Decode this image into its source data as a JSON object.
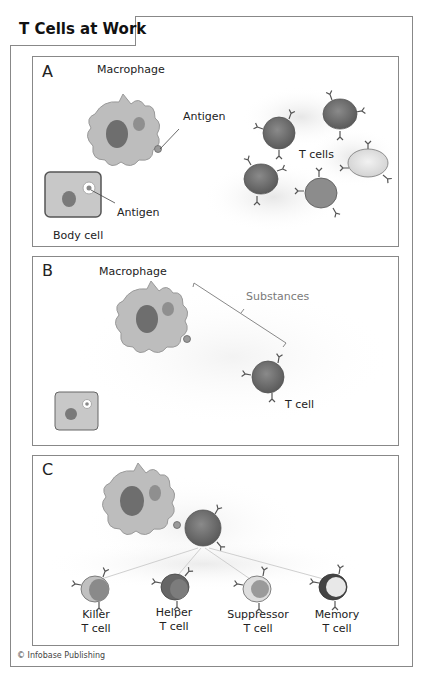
{
  "title": "T Cells at Work",
  "panels": {
    "a": {
      "letter": "A",
      "macrophage_label": "Macrophage",
      "antigen_label_1": "Antigen",
      "antigen_label_2": "Antigen",
      "body_cell_label": "Body cell",
      "t_cells_label": "T cells"
    },
    "b": {
      "letter": "B",
      "macrophage_label": "Macrophage",
      "substances_label": "Substances",
      "t_cell_label": "T cell"
    },
    "c": {
      "letter": "C",
      "cell_types": [
        {
          "line1": "Killer",
          "line2": "T cell"
        },
        {
          "line1": "Helper",
          "line2": "T cell"
        },
        {
          "line1": "Suppressor",
          "line2": "T cell"
        },
        {
          "line1": "Memory",
          "line2": "T cell"
        }
      ]
    }
  },
  "credit": "© Infobase Publishing",
  "colors": {
    "border": "#888888",
    "macrophage": "#b9b9b9",
    "nucleus": "#6e6e6e",
    "t_cell": "#7a7a7a",
    "substances_text": "#7a7a7a"
  }
}
